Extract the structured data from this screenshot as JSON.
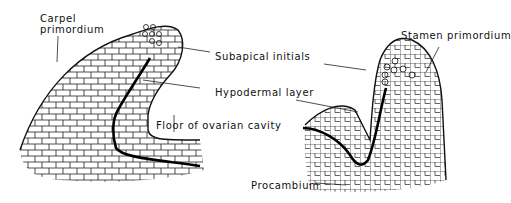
{
  "diagram": {
    "type": "botanical-section",
    "panels": [
      {
        "name": "carpel",
        "labels": {
          "carpel_primordium_line1": "Carpel",
          "carpel_primordium_line2": "primordium",
          "subapical_initials": "Subapical initials",
          "hypodermal_layer": "Hypodermal layer",
          "floor_of_ovarian_cavity": "Floor of ovarian cavity"
        }
      },
      {
        "name": "stamen",
        "labels": {
          "stamen_primordium": "Stamen primordium",
          "procambium": "Procambium"
        }
      }
    ],
    "colors": {
      "line": "#111111",
      "background": "#ffffff"
    }
  }
}
